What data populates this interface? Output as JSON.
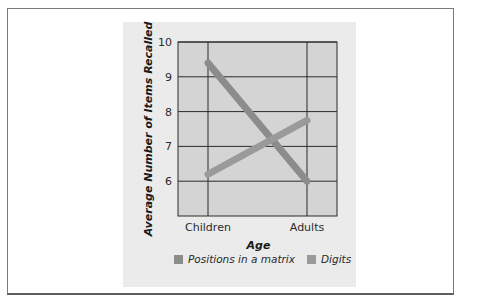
{
  "chart_data": {
    "type": "line",
    "title": "",
    "xlabel": "Age",
    "ylabel": "Average Number of Items Recalled",
    "categories": [
      "Children",
      "Adults"
    ],
    "series": [
      {
        "name": "Positions in a matrix",
        "values": [
          9.4,
          6.0
        ],
        "color": "#8c8c8c"
      },
      {
        "name": "Digits",
        "values": [
          6.2,
          7.75
        ],
        "color": "#9a9a9a"
      }
    ],
    "ylim": [
      5,
      10
    ],
    "yticks": [
      6,
      7,
      8,
      9,
      10
    ],
    "grid": true,
    "legend_position": "bottom"
  },
  "colors": {
    "panel_bg": "#ebebeb",
    "plot_bg": "#d4d4d4",
    "grid": "#2b2b2b"
  }
}
